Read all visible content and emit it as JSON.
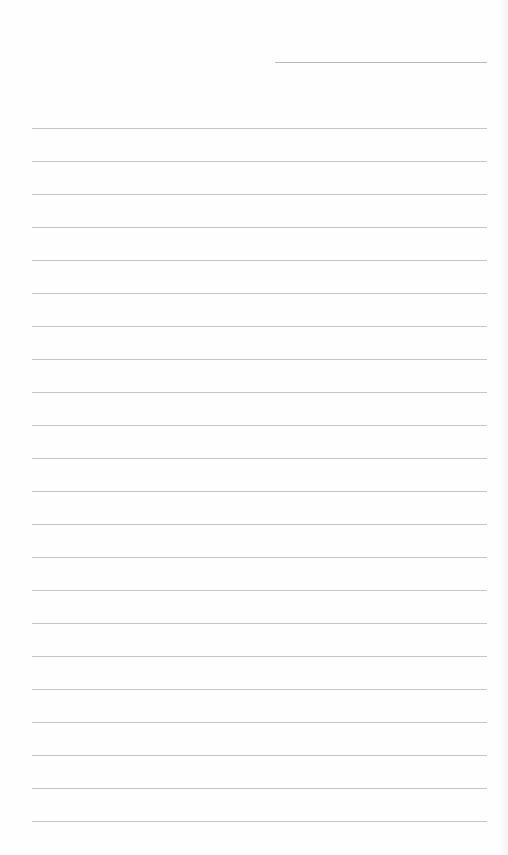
{
  "document": {
    "type": "lined-writing-paper",
    "header_field": {
      "label": "",
      "value": ""
    },
    "line_count": 22,
    "first_line_y": 128,
    "line_spacing": 33,
    "lines": [
      "",
      "",
      "",
      "",
      "",
      "",
      "",
      "",
      "",
      "",
      "",
      "",
      "",
      "",
      "",
      "",
      "",
      "",
      "",
      "",
      "",
      ""
    ],
    "colors": {
      "paper": "#fefefe",
      "rule": "#c4c4c4"
    }
  }
}
